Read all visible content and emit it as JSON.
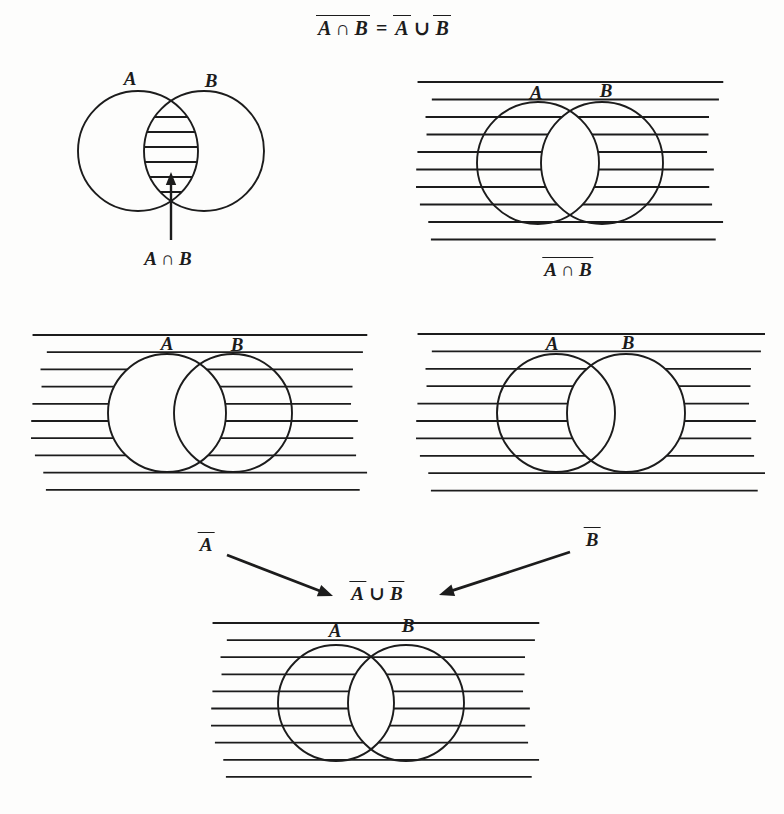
{
  "colors": {
    "ink": "#1c1c1c",
    "background": "#fdfdfc"
  },
  "formula": {
    "lhs": "A ∩ B",
    "equals": "=",
    "rhs_a": "A",
    "union": "∪",
    "rhs_b": "B"
  },
  "panel_intersection": {
    "label_a": "A",
    "label_b": "B",
    "caption": "A ∩ B"
  },
  "panel_complement_intersection": {
    "label_a": "A",
    "label_b": "B",
    "caption": "A ∩ B"
  },
  "panel_complement_a": {
    "label_a": "A",
    "label_b": "B"
  },
  "panel_complement_b": {
    "label_a": "A",
    "label_b": "B"
  },
  "connector": {
    "a_bar": "A",
    "b_bar": "B",
    "expr_a": "A",
    "expr_union": "∪",
    "expr_b": "B"
  },
  "panel_union_result": {
    "label_a": "A",
    "label_b": "B"
  }
}
